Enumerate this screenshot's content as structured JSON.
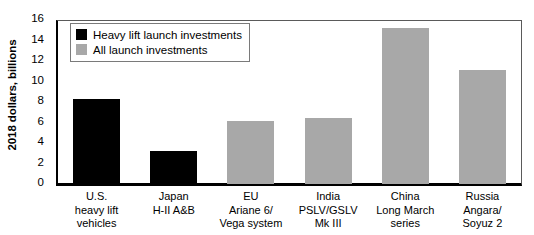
{
  "chart_data": {
    "type": "bar",
    "title": "",
    "xlabel": "",
    "ylabel": "2018 dollars, billions",
    "ylim": [
      0,
      16
    ],
    "yticks": [
      0,
      2,
      4,
      6,
      8,
      10,
      12,
      14,
      16
    ],
    "grid": false,
    "legend_position": "upper-left inside plot",
    "categories": [
      "U.S.\nheavy lift\nvehicles",
      "Japan\nH-II A&B",
      "EU\nAriane 6/\nVega system",
      "India\nPSLV/GSLV\nMk III",
      "China\nLong March\nseries",
      "Russia\nAngara/\nSoyuz 2"
    ],
    "category_lines": [
      [
        "U.S.",
        "heavy lift",
        "vehicles"
      ],
      [
        "Japan",
        "H-II A&B"
      ],
      [
        "EU",
        "Ariane 6/",
        "Vega system"
      ],
      [
        "India",
        "PSLV/GSLV",
        "Mk III"
      ],
      [
        "China",
        "Long March",
        "series"
      ],
      [
        "Russia",
        "Angara/",
        "Soyuz 2"
      ]
    ],
    "values": [
      8.3,
      3.2,
      6.1,
      6.4,
      15.2,
      11.1
    ],
    "series_of_bar": [
      "heavy",
      "heavy",
      "all",
      "all",
      "all",
      "all"
    ],
    "series": [
      {
        "name": "Heavy lift launch investments",
        "key": "heavy",
        "color": "#000000",
        "points": [
          {
            "category": "U.S. heavy lift vehicles",
            "value": 8.3
          },
          {
            "category": "Japan H-II A&B",
            "value": 3.2
          }
        ]
      },
      {
        "name": "All launch investments",
        "key": "all",
        "color": "#a8a8a8",
        "points": [
          {
            "category": "EU Ariane 6/ Vega system",
            "value": 6.1
          },
          {
            "category": "India PSLV/GSLV Mk III",
            "value": 6.4
          },
          {
            "category": "China Long March series",
            "value": 15.2
          },
          {
            "category": "Russia Angara/ Soyuz 2",
            "value": 11.1
          }
        ]
      }
    ]
  },
  "legend": {
    "items": [
      {
        "label": "Heavy lift launch investments",
        "color": "#000000"
      },
      {
        "label": "All launch investments",
        "color": "#a8a8a8"
      }
    ]
  },
  "axis": {
    "y_title": "2018 dollars, billions",
    "y_tick_labels": [
      "16",
      "14",
      "12",
      "10",
      "8",
      "6",
      "4",
      "2",
      "0"
    ]
  }
}
